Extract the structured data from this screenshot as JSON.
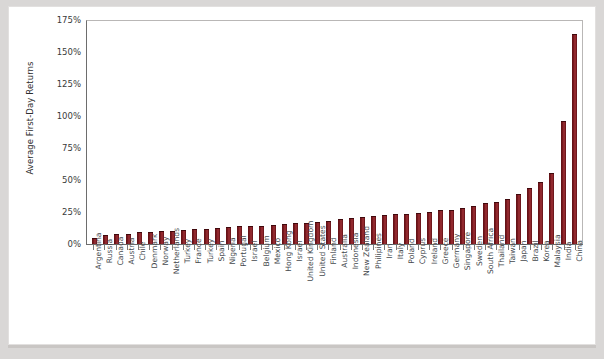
{
  "chart_data": {
    "type": "bar",
    "title": "",
    "xlabel": "",
    "ylabel": "Average First-Day Returns",
    "ylim": [
      0,
      175
    ],
    "ytick_labels": [
      "175%",
      "150%",
      "125%",
      "100%",
      "75%",
      "50%",
      "25%",
      "0%"
    ],
    "ytick_values": [
      175,
      150,
      125,
      100,
      75,
      50,
      25,
      0
    ],
    "grid": false,
    "legend": false,
    "bar_color": "#6d141a",
    "categories": [
      "Argentina",
      "Russia",
      "Canada",
      "Austria",
      "Chile",
      "Denmark",
      "Norway",
      "Netherlands",
      "Turkey",
      "France",
      "Turkey",
      "Spain",
      "Nigeria",
      "Portugal",
      "Israel",
      "Belgium",
      "Mexico",
      "Hong Kong",
      "Israel",
      "United Kingdom",
      "United States",
      "Finland",
      "Australia",
      "Indonesia",
      "New Zealand",
      "Philipines",
      "Iran",
      "Italy",
      "Poland",
      "Cyprus",
      "Ireland",
      "Greece",
      "Germany",
      "Singapore",
      "Sweden",
      "South Africa",
      "Thailand",
      "Taiwan",
      "Japan",
      "Brazil",
      "Korea",
      "Malaysia",
      "India",
      "China"
    ],
    "values": [
      4.2,
      6.5,
      6.9,
      7.3,
      8.4,
      8.6,
      9.3,
      9.6,
      10.1,
      10.7,
      11.0,
      11.4,
      12.7,
      13.0,
      13.4,
      13.6,
      14.0,
      15.0,
      15.3,
      16.0,
      16.5,
      17.2,
      18.5,
      19.2,
      20.0,
      21.0,
      22.0,
      22.4,
      23.0,
      23.8,
      24.5,
      25.5,
      26.0,
      27.5,
      29.0,
      31.0,
      32.0,
      34.0,
      38.0,
      43.0,
      48.0,
      55.0,
      95.0,
      163.0
    ]
  }
}
